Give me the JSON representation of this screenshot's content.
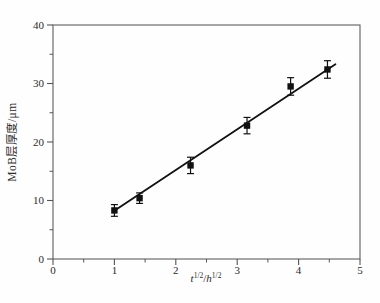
{
  "figure": {
    "background": "#fefefe"
  },
  "colors": {
    "frame": "#6b6b6b",
    "tick": "#555555",
    "text": "#2b2b2b",
    "data": "#111111"
  },
  "chart_data": {
    "type": "scatter",
    "title": "",
    "xlabel": "t^{1/2}/h^{1/2}",
    "xlabel_parts": [
      "t",
      "1/2",
      "/",
      "h",
      "1/2"
    ],
    "ylabel": "MoB层厚度/μm",
    "xlim": [
      0,
      5
    ],
    "ylim": [
      0,
      40
    ],
    "xticks": [
      0,
      1,
      2,
      3,
      4,
      5
    ],
    "yticks": [
      0,
      10,
      20,
      30,
      40
    ],
    "xticks_minor": [
      0.5,
      1.5,
      2.5,
      3.5,
      4.5
    ],
    "yticks_minor": [
      5,
      15,
      25,
      35
    ],
    "grid": false,
    "legend": null,
    "series": [
      {
        "name": "MoB layer thickness",
        "marker": "square",
        "color": "#111111",
        "points": [
          {
            "x": 1.0,
            "y": 8.3,
            "yerr": 1.0
          },
          {
            "x": 1.41,
            "y": 10.4,
            "yerr": 0.9
          },
          {
            "x": 2.24,
            "y": 16.0,
            "yerr": 1.4
          },
          {
            "x": 3.16,
            "y": 22.8,
            "yerr": 1.4
          },
          {
            "x": 3.87,
            "y": 29.5,
            "yerr": 1.5
          },
          {
            "x": 4.47,
            "y": 32.4,
            "yerr": 1.5
          }
        ]
      }
    ],
    "fit_line": {
      "x1": 0.98,
      "y1": 8.1,
      "x2": 4.6,
      "y2": 33.3,
      "color": "#111111"
    }
  }
}
